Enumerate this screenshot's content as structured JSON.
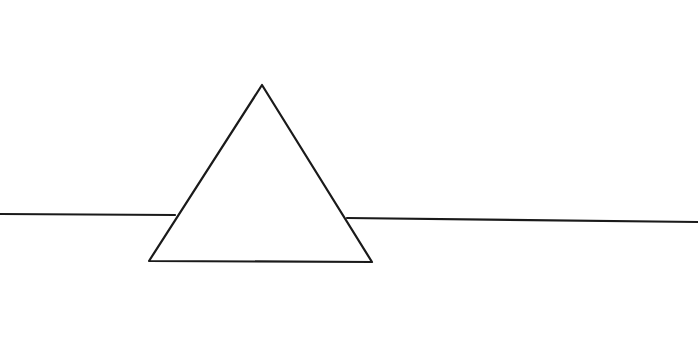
{
  "drawing": {
    "background": "#ffffff",
    "stroke_color": "#1a1a1a",
    "stroke_width": 2.2,
    "triangle": {
      "apex": [
        262,
        85
      ],
      "bottom_left": [
        149,
        261
      ],
      "bottom_right": [
        372,
        262
      ]
    },
    "horizon_left": {
      "from": [
        0,
        214
      ],
      "to": [
        175,
        215
      ]
    },
    "horizon_right": {
      "from": [
        347,
        218
      ],
      "to": [
        698,
        222
      ]
    }
  }
}
